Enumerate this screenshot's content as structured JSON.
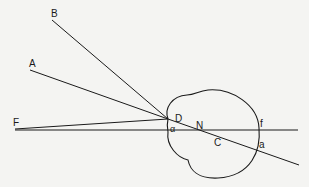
{
  "diagram": {
    "title": "",
    "labels": {
      "A": "A",
      "B": "B",
      "F": "F",
      "D": "D",
      "alpha": "α",
      "N": "N",
      "C": "C",
      "f": "f",
      "a": "a"
    },
    "colors": {
      "line": "#1a1a1a",
      "background": "#f4f4f2"
    }
  }
}
